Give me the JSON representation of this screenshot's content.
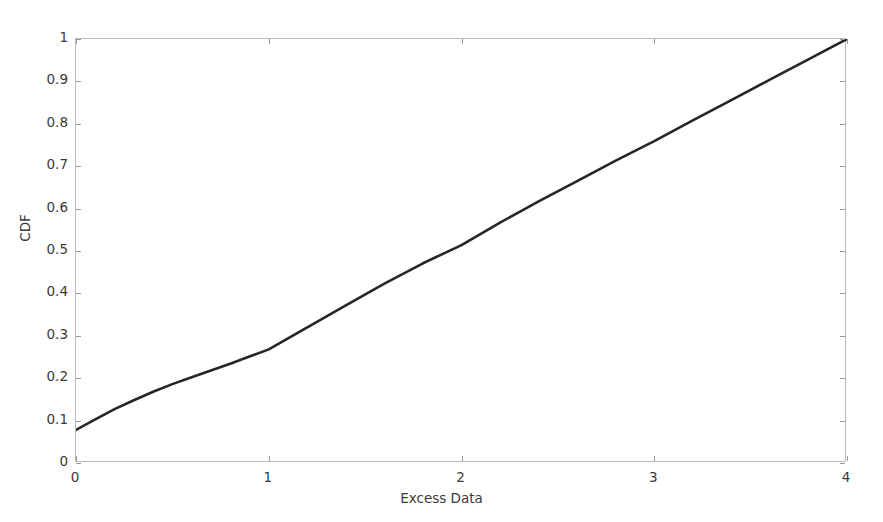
{
  "chart_data": {
    "type": "line",
    "title": "",
    "xlabel": "Excess Data",
    "ylabel": "CDF",
    "xlim": [
      0,
      4
    ],
    "ylim": [
      0,
      1
    ],
    "grid": false,
    "legend": null,
    "line_color": "#262626",
    "axis_color": "#b9b9b9",
    "xticks": [
      0,
      1,
      2,
      3,
      4
    ],
    "xtick_labels": [
      "0",
      "1",
      "2",
      "3",
      "4"
    ],
    "yticks": [
      0,
      0.1,
      0.2,
      0.3,
      0.4,
      0.5,
      0.6,
      0.7,
      0.8,
      0.9,
      1
    ],
    "ytick_labels": [
      "0",
      "0.1",
      "0.2",
      "0.3",
      "0.4",
      "0.5",
      "0.6",
      "0.7",
      "0.8",
      "0.9",
      "1"
    ],
    "series": [
      {
        "name": "CDF",
        "x": [
          0.0,
          0.1,
          0.2,
          0.3,
          0.4,
          0.5,
          0.6,
          0.7,
          0.8,
          0.9,
          1.0,
          1.2,
          1.4,
          1.6,
          1.8,
          2.0,
          2.2,
          2.4,
          2.6,
          2.8,
          3.0,
          3.2,
          3.4,
          3.6,
          3.8,
          4.0
        ],
        "y": [
          0.078,
          0.103,
          0.127,
          0.148,
          0.168,
          0.186,
          0.202,
          0.218,
          0.234,
          0.251,
          0.268,
          0.32,
          0.372,
          0.423,
          0.471,
          0.514,
          0.567,
          0.617,
          0.665,
          0.713,
          0.759,
          0.808,
          0.856,
          0.904,
          0.952,
          1.0
        ]
      }
    ]
  },
  "axes": {
    "x_title": "Excess Data",
    "y_title": "CDF"
  }
}
